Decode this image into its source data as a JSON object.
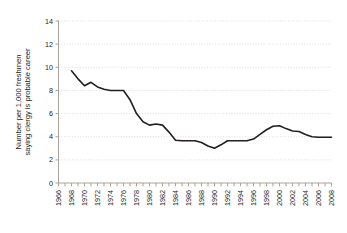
{
  "chart_data": {
    "type": "line",
    "title": "",
    "subtitle": "",
    "xlabel": "",
    "ylabel": "Number per 1,000 freshmen saying clergy is probable career",
    "ylabel_line1": "Number per 1,000 freshmen",
    "ylabel_line2": "saying clergy is probable career",
    "xlim": [
      1966,
      2008
    ],
    "ylim": [
      0,
      14
    ],
    "yticks": [
      0,
      2,
      4,
      6,
      8,
      10,
      12,
      14
    ],
    "ytick_labels": [
      "0",
      "2",
      "4",
      "6",
      "8",
      "10",
      "12",
      "14"
    ],
    "xticks": [
      1966,
      1968,
      1970,
      1972,
      1974,
      1976,
      1978,
      1980,
      1982,
      1984,
      1986,
      1988,
      1990,
      1992,
      1994,
      1996,
      1998,
      2000,
      2002,
      2004,
      2006,
      2008
    ],
    "xtick_labels": [
      "1966",
      "1968",
      "1970",
      "1972",
      "1974",
      "1976",
      "1978",
      "1980",
      "1982",
      "1984",
      "1986",
      "1988",
      "1990",
      "1992",
      "1994",
      "1996",
      "1998",
      "2000",
      "2002",
      "2004",
      "2006",
      "2008"
    ],
    "x_minor_tick_step": 1,
    "grid": {
      "horizontal": true,
      "vertical": false,
      "style": "dotted",
      "color": "#d9d4cd"
    },
    "legend": {
      "visible": false,
      "position": "none"
    },
    "line_color": "#231f20",
    "line_width": 1.6,
    "axis_color": "#a9a39b",
    "background": "#ffffff",
    "series": [
      {
        "name": "Clergy as probable career",
        "x": [
          1968,
          1969,
          1970,
          1971,
          1972,
          1973,
          1974,
          1975,
          1976,
          1977,
          1978,
          1979,
          1980,
          1981,
          1982,
          1983,
          1984,
          1985,
          1986,
          1987,
          1988,
          1989,
          1990,
          1991,
          1992,
          1993,
          1994,
          1995,
          1996,
          1997,
          1998,
          1999,
          2000,
          2001,
          2002,
          2003,
          2004,
          2005,
          2006,
          2007,
          2008
        ],
        "values": [
          9.7,
          9.0,
          8.4,
          8.7,
          8.3,
          8.1,
          8.0,
          8.0,
          8.0,
          7.2,
          6.0,
          5.3,
          5.0,
          5.1,
          5.0,
          4.4,
          3.7,
          3.65,
          3.65,
          3.65,
          3.5,
          3.2,
          3.0,
          3.3,
          3.65,
          3.65,
          3.65,
          3.65,
          3.8,
          4.2,
          4.6,
          4.9,
          4.95,
          4.7,
          4.5,
          4.45,
          4.2,
          4.0,
          3.95,
          3.95,
          3.95
        ]
      }
    ]
  }
}
